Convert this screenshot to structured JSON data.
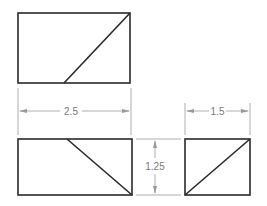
{
  "drawing": {
    "title": "Orthographic projection views",
    "views": [
      {
        "name": "top-view",
        "rect": {
          "x": 18,
          "y": 13,
          "w": 112,
          "h": 70
        },
        "diagonal": {
          "x1": 64,
          "y1": 83,
          "x2": 130,
          "y2": 13
        }
      },
      {
        "name": "front-view",
        "rect": {
          "x": 18,
          "y": 139,
          "w": 114,
          "h": 56
        },
        "diagonal": {
          "x1": 67,
          "y1": 139,
          "x2": 132,
          "y2": 195
        }
      },
      {
        "name": "side-view",
        "rect": {
          "x": 185,
          "y": 139,
          "w": 65,
          "h": 56
        },
        "diagonal": {
          "x1": 185,
          "y1": 195,
          "x2": 250,
          "y2": 139
        }
      }
    ],
    "dimensions": {
      "width_front": "2.5",
      "width_side": "1.5",
      "height": "1.25"
    },
    "colors": {
      "object_line": "#2a2a2a",
      "dimension_line": "#9a9a9a",
      "dimension_text": "#7a7a7a"
    }
  }
}
